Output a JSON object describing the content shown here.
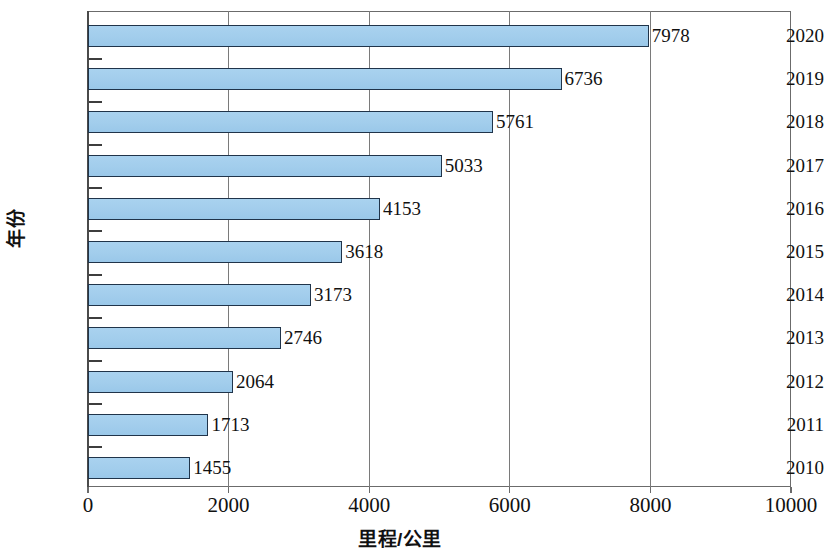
{
  "chart_data": {
    "type": "bar",
    "orientation": "horizontal",
    "title": "",
    "xlabel": "里程/公里",
    "ylabel": "年份",
    "categories": [
      "2020",
      "2019",
      "2018",
      "2017",
      "2016",
      "2015",
      "2014",
      "2013",
      "2012",
      "2011",
      "2010"
    ],
    "values": [
      7978,
      6736,
      5761,
      5033,
      4153,
      3618,
      3173,
      2746,
      2064,
      1713,
      1455
    ],
    "data_labels": [
      "7978",
      "6736",
      "5761",
      "5033",
      "4153",
      "3618",
      "3173",
      "2746",
      "2064",
      "1713",
      "1455"
    ],
    "xlim": [
      0,
      10000
    ],
    "xticks": [
      0,
      2000,
      4000,
      6000,
      8000,
      10000
    ],
    "xtick_labels": [
      "0",
      "2000",
      "4000",
      "6000",
      "8000",
      "10000"
    ],
    "grid": "vertical-gridlines-at-2000-4000-6000-8000",
    "legend": "none",
    "bar_fill_color": "#a2cdec",
    "bar_border_color": "#20344a",
    "frame_color": "#6b6b6b",
    "gridline_color": "#7a7a7a",
    "background_color": "#ffffff"
  }
}
